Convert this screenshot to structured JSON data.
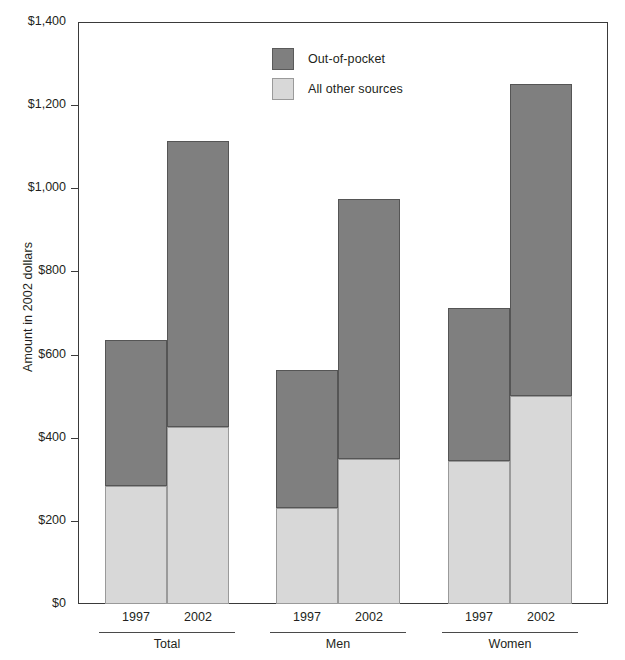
{
  "chart_data": {
    "type": "bar",
    "subtype": "stacked-bar-grouped",
    "title": "",
    "xlabel": "",
    "ylabel": "Amount in 2002 dollars",
    "ylim": [
      0,
      1400
    ],
    "ytick_step": 200,
    "ytick_labels": [
      "$1,400",
      "$1,200",
      "$1,000",
      "$800",
      "$600",
      "$400",
      "$200",
      "$0"
    ],
    "ytick_values": [
      1400,
      1200,
      1000,
      800,
      600,
      400,
      200,
      0
    ],
    "grid": false,
    "legend_position": "top-center",
    "categories": [
      "Total 1997",
      "Total 2002",
      "Men 1997",
      "Men 2002",
      "Women 1997",
      "Women 2002"
    ],
    "groups": [
      {
        "label": "Total",
        "bars": [
          {
            "year": "1997",
            "all_other_sources": 283,
            "out_of_pocket": 352,
            "total": 635
          },
          {
            "year": "2002",
            "all_other_sources": 425,
            "out_of_pocket": 688,
            "total": 1113
          }
        ]
      },
      {
        "label": "Men",
        "bars": [
          {
            "year": "1997",
            "all_other_sources": 232,
            "out_of_pocket": 330,
            "total": 562
          },
          {
            "year": "2002",
            "all_other_sources": 350,
            "out_of_pocket": 625,
            "total": 975
          }
        ]
      },
      {
        "label": "Women",
        "bars": [
          {
            "year": "1997",
            "all_other_sources": 343,
            "out_of_pocket": 369,
            "total": 712
          },
          {
            "year": "2002",
            "all_other_sources": 500,
            "out_of_pocket": 750,
            "total": 1250
          }
        ]
      }
    ],
    "series": [
      {
        "name": "All other sources",
        "color": "#d8d8d8",
        "values": [
          283,
          425,
          232,
          350,
          343,
          500
        ]
      },
      {
        "name": "Out-of-pocket",
        "color": "#7f7f7f",
        "values": [
          352,
          688,
          330,
          625,
          369,
          750
        ]
      }
    ]
  },
  "legend": {
    "items": [
      {
        "label": "Out-of-pocket",
        "color": "#7f7f7f",
        "swatch": "oop"
      },
      {
        "label": "All other sources",
        "color": "#d8d8d8",
        "swatch": "other"
      }
    ]
  },
  "colors": {
    "out_of_pocket": "#7f7f7f",
    "all_other_sources": "#d8d8d8",
    "axis": "#3a3a3a",
    "text": "#231f20",
    "background": "#ffffff"
  }
}
